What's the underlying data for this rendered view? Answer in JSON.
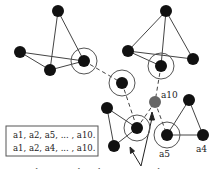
{
  "diagram": {
    "colors": {
      "node": "#111111",
      "highlight_node": "#666666",
      "edge": "#444444",
      "ring": "#555555",
      "box_border": "#555555"
    },
    "nodes": [
      {
        "id": "tl1",
        "x": 58,
        "y": 11
      },
      {
        "id": "tl2",
        "x": 20,
        "y": 52
      },
      {
        "id": "tl3",
        "x": 50,
        "y": 70
      },
      {
        "id": "tl4",
        "x": 84,
        "y": 61,
        "ringed": true
      },
      {
        "id": "tr1",
        "x": 166,
        "y": 11
      },
      {
        "id": "tr2",
        "x": 128,
        "y": 51
      },
      {
        "id": "tr3",
        "x": 193,
        "y": 59
      },
      {
        "id": "tr4",
        "x": 161,
        "y": 66,
        "ringed": true
      },
      {
        "id": "mid",
        "x": 122,
        "y": 83,
        "ringed": true
      },
      {
        "id": "a10",
        "x": 155,
        "y": 102,
        "label": "a10",
        "highlight": true
      },
      {
        "id": "bl1",
        "x": 107,
        "y": 108
      },
      {
        "id": "bl2",
        "x": 114,
        "y": 146
      },
      {
        "id": "bl3",
        "x": 137,
        "y": 128,
        "ringed": true
      },
      {
        "id": "a5",
        "x": 167,
        "y": 135,
        "label": "a5",
        "ringed": true
      },
      {
        "id": "br1",
        "x": 189,
        "y": 100
      },
      {
        "id": "a4",
        "x": 203,
        "y": 135,
        "label": "a4"
      }
    ],
    "edges_solid": [
      [
        "tl1",
        "tl3"
      ],
      [
        "tl1",
        "tl4"
      ],
      [
        "tl2",
        "tl3"
      ],
      [
        "tl2",
        "tl4"
      ],
      [
        "tl3",
        "tl4"
      ],
      [
        "tr1",
        "tr2"
      ],
      [
        "tr1",
        "tr3"
      ],
      [
        "tr1",
        "tr4"
      ],
      [
        "tr2",
        "tr3"
      ],
      [
        "tr2",
        "tr4"
      ],
      [
        "bl1",
        "bl2"
      ],
      [
        "bl1",
        "bl3"
      ],
      [
        "bl2",
        "bl3"
      ],
      [
        "a5",
        "br1"
      ],
      [
        "a5",
        "a4"
      ],
      [
        "br1",
        "a4"
      ]
    ],
    "edges_dashed": [
      [
        "tl4",
        "mid"
      ],
      [
        "mid",
        "bl3"
      ],
      [
        "tr4",
        "a10"
      ],
      [
        "a10",
        "bl3"
      ],
      [
        "a10",
        "a5"
      ]
    ],
    "box": {
      "line1": "a1, a2, a5,  ... , a10.",
      "line2": "a1, a2, a4, ... , a10."
    },
    "labels": {
      "a10": "a10",
      "a5": "a5",
      "a4": "a4"
    },
    "caption": "Sharing path with recovery probing"
  }
}
